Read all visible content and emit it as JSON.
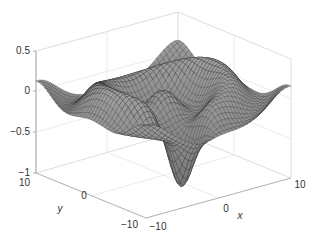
{
  "chart_data": {
    "type": "surface",
    "title": "",
    "xlabel": "x",
    "ylabel": "y",
    "zlabel": "",
    "xlim": [
      -10,
      10
    ],
    "ylim": [
      -10,
      10
    ],
    "zlim": [
      -1,
      0.5
    ],
    "x_ticks": [
      "-10",
      "0",
      "10"
    ],
    "y_ticks": [
      "-10",
      "0",
      "10"
    ],
    "z_ticks": [
      "0.5",
      "0",
      "-0.5",
      "-1"
    ],
    "grid": true,
    "surface_color": "#8a8a8a",
    "mesh_line_color": "#2b2b2b",
    "grid_resolution": 41
  },
  "labels": {
    "z_0_5": "0.5",
    "z_0": "0",
    "z_m0_5": "-0.5",
    "z_m1": "-1",
    "y_10": "10",
    "y_0": "0",
    "y_m10": "-10",
    "x_m10": "-10",
    "x_0": "0",
    "x_10": "10",
    "x_axis": "x",
    "y_axis": "y"
  }
}
